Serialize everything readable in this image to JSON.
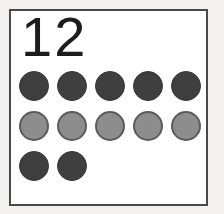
{
  "card": {
    "numeral": "12",
    "background_color": "#ffffff",
    "border_color": "#4a4a4a",
    "page_background_color": "#f2f1ef"
  },
  "counting_display": {
    "total_count": 12,
    "dark_color": "#3f3f3f",
    "light_color": "#8d8d8d",
    "light_outline_color": "#5b5b5b",
    "rows": [
      {
        "shade": "dark",
        "count": 5
      },
      {
        "shade": "light",
        "count": 5
      },
      {
        "shade": "dark",
        "count": 2
      }
    ]
  }
}
